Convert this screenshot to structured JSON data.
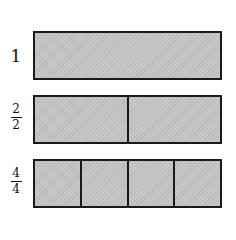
{
  "diagram": {
    "title": "",
    "colors": {
      "fill": "#c4c4c4",
      "stroke": "#1a1a1a",
      "background": "#ffffff"
    },
    "rows": [
      {
        "label_type": "whole",
        "label": "1",
        "numerator": "",
        "denominator": "",
        "parts": 1
      },
      {
        "label_type": "fraction",
        "label": "2/2",
        "numerator": "2",
        "denominator": "2",
        "parts": 2
      },
      {
        "label_type": "fraction",
        "label": "4/4",
        "numerator": "4",
        "denominator": "4",
        "parts": 4
      }
    ]
  }
}
